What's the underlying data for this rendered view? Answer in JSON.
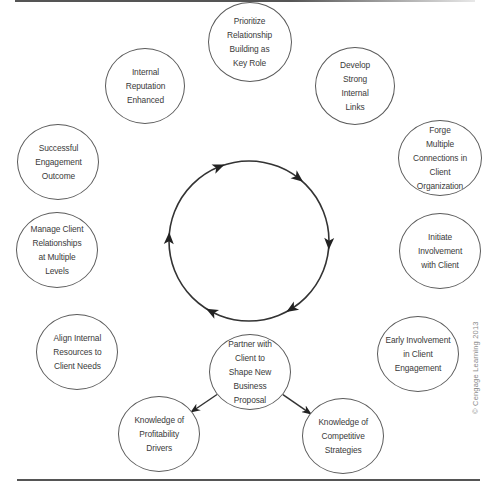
{
  "diagram": {
    "type": "cycle",
    "cycle_direction": "clockwise",
    "center_circle": {
      "cx": 249,
      "cy": 241,
      "r": 80,
      "arrow_count": 6
    },
    "nodes": [
      {
        "id": "prioritize",
        "label": "Prioritize\nRelationship\nBuilding as\nKey Role",
        "cx": 250,
        "cy": 42,
        "rx": 42,
        "ry": 40
      },
      {
        "id": "develop",
        "label": "Develop\nStrong\nInternal\nLinks",
        "cx": 355,
        "cy": 86,
        "rx": 40,
        "ry": 39
      },
      {
        "id": "forge",
        "label": "Forge\nMultiple\nConnections in Client\nOrganization",
        "cx": 440,
        "cy": 158,
        "rx": 42,
        "ry": 38
      },
      {
        "id": "initiate",
        "label": "Initiate\nInvolvement\nwith Client",
        "cx": 440,
        "cy": 251,
        "rx": 41,
        "ry": 38
      },
      {
        "id": "early",
        "label": "Early Involvement\nin Client Engagement",
        "cx": 418,
        "cy": 354,
        "rx": 41,
        "ry": 38
      },
      {
        "id": "competitive",
        "label": "Knowledge of\nCompetitive\nStrategies",
        "cx": 343,
        "cy": 436,
        "rx": 41,
        "ry": 38
      },
      {
        "id": "partner",
        "label": "Partner with\nClient to\nShape New Business\nProposal",
        "cx": 250,
        "cy": 372,
        "rx": 41,
        "ry": 38
      },
      {
        "id": "profitability",
        "label": "Knowledge of\nProfitability\nDrivers",
        "cx": 159,
        "cy": 434,
        "rx": 41,
        "ry": 38
      },
      {
        "id": "align",
        "label": "Align Internal\nResources to\nClient Needs",
        "cx": 77,
        "cy": 352,
        "rx": 41,
        "ry": 38
      },
      {
        "id": "manage",
        "label": "Manage Client\nRelationships\nat Multiple\nLevels",
        "cx": 57,
        "cy": 250,
        "rx": 41,
        "ry": 38
      },
      {
        "id": "successful",
        "label": "Successful\nEngagement\nOutcome",
        "cx": 58,
        "cy": 162,
        "rx": 41,
        "ry": 38
      },
      {
        "id": "reputation",
        "label": "Internal\nReputation\nEnhanced",
        "cx": 145,
        "cy": 86,
        "rx": 40,
        "ry": 38
      }
    ],
    "edges": [
      {
        "from": "partner",
        "to": "profitability"
      },
      {
        "from": "partner",
        "to": "competitive"
      }
    ],
    "copyright": "© Cengage Learning 2013"
  }
}
